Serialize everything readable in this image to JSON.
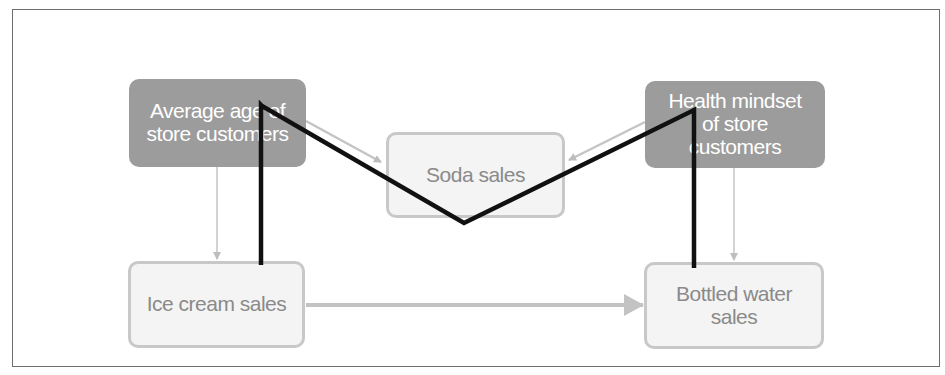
{
  "diagram": {
    "type": "causal-graph",
    "nodes": [
      {
        "id": "avg_age",
        "label": "Average age of\nstore customers",
        "style": "dark"
      },
      {
        "id": "soda",
        "label": "Soda sales",
        "style": "light"
      },
      {
        "id": "health",
        "label": "Health mindset\nof store\ncustomers",
        "style": "dark"
      },
      {
        "id": "ice_cream",
        "label": "Ice cream sales",
        "style": "light"
      },
      {
        "id": "water",
        "label": "Bottled water\nsales",
        "style": "light"
      }
    ],
    "edges": [
      {
        "from": "avg_age",
        "to": "soda",
        "style": "thin-gray-arrow"
      },
      {
        "from": "health",
        "to": "soda",
        "style": "thin-gray-arrow"
      },
      {
        "from": "avg_age",
        "to": "ice_cream",
        "style": "thin-gray-arrow"
      },
      {
        "from": "health",
        "to": "water",
        "style": "thin-gray-arrow"
      },
      {
        "from": "ice_cream",
        "to": "water",
        "style": "thick-gray-arrow"
      }
    ],
    "highlighted_path": {
      "description": "Black path: Ice cream sales - Average age - Soda sales - Health mindset - Bottled water sales",
      "sequence": [
        "ice_cream",
        "avg_age",
        "soda",
        "health",
        "water"
      ],
      "color": "#111111"
    }
  },
  "colors": {
    "dark_node_fill": "#9c9c9c",
    "light_node_fill": "#f4f4f4",
    "light_node_border": "#c8c8c8",
    "arrow_gray": "#bdbdbd",
    "path_black": "#111111",
    "frame": "#6e6e6e"
  }
}
